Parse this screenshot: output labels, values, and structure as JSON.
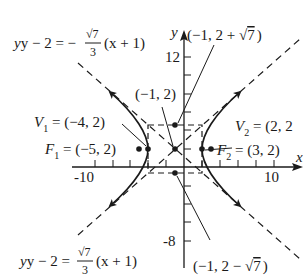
{
  "figure": {
    "axes": {
      "x_label": "x",
      "y_label": "y",
      "x_ticks": {
        "labeled": [
          "-10",
          "10"
        ],
        "step": 2
      },
      "y_ticks": {
        "labeled": [
          "12",
          "-8"
        ],
        "step": 2
      }
    },
    "points": {
      "center": {
        "label": "(−1, 2)"
      },
      "v1": {
        "name": "V",
        "sub": "1",
        "value": " = (−4, 2)"
      },
      "v2": {
        "name": "V",
        "sub": "2",
        "value": " = (2, 2"
      },
      "f1": {
        "name": "F",
        "sub": "1",
        "value": " = (−5, 2)"
      },
      "f2": {
        "name": "F",
        "sub": "2",
        "value": " = (3, 2)"
      },
      "top": {
        "label_a": "(−1, 2 + ",
        "label_b": "7",
        "label_c": ")"
      },
      "bottom": {
        "label_a": "(−1, 2 − ",
        "label_b": "7",
        "label_c": ")"
      }
    },
    "asymptotes": {
      "upper_left": {
        "lhs": "y − 2 = −",
        "num": "√7",
        "den": "3",
        "rhs": "(x + 1)"
      },
      "lower_left": {
        "lhs": "y − 2 = ",
        "num": "√7",
        "den": "3",
        "rhs": "(x + 1)"
      }
    },
    "colors": {
      "ink": "#1a1a1a",
      "background": "#ffffff"
    }
  }
}
